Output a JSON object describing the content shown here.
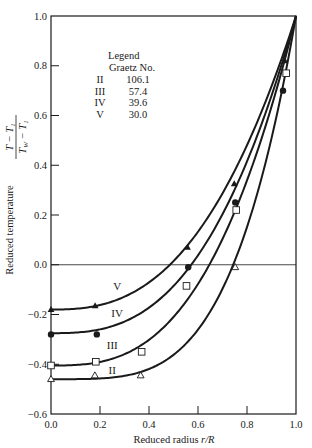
{
  "chart_data": {
    "type": "line",
    "title": "",
    "xlabel": "Reduced radius r/R",
    "ylabel": "Reduced temperature (T - T_1)/(T_W - T_1)",
    "xlim": [
      0.0,
      1.0
    ],
    "ylim": [
      -0.6,
      1.0
    ],
    "xticks": [
      "0.0",
      "0.2",
      "0.4",
      "0.6",
      "0.8",
      "1.0"
    ],
    "yticks": [
      "1.0",
      "0.8",
      "0.6",
      "0.4",
      "0.2",
      "0.0",
      "-0.2",
      "-0.4",
      "-0.6"
    ],
    "grid": false,
    "reference_line": {
      "y": 0.0
    },
    "legend": {
      "title": "Legend",
      "subtitle": "Graetz No.",
      "position": "upper-left",
      "entries": [
        {
          "label": "II",
          "value": "106.1",
          "marker": "open-triangle"
        },
        {
          "label": "III",
          "value": "57.4",
          "marker": "open-square"
        },
        {
          "label": "IV",
          "value": "39.6",
          "marker": "filled-circle"
        },
        {
          "label": "V",
          "value": "30.0",
          "marker": "filled-triangle"
        }
      ]
    },
    "series": [
      {
        "name": "V",
        "graetz": 30.0,
        "marker": "filled-triangle",
        "curve": {
          "a": -0.18,
          "n": 2.6
        },
        "label_pos": [
          0.27,
          -0.1
        ],
        "points": [
          [
            0.0,
            -0.18
          ],
          [
            0.18,
            -0.165
          ],
          [
            0.557,
            0.07
          ],
          [
            0.748,
            0.325
          ],
          [
            0.955,
            0.82
          ]
        ]
      },
      {
        "name": "IV",
        "graetz": 39.6,
        "marker": "filled-circle",
        "curve": {
          "a": -0.275,
          "n": 2.75
        },
        "label_pos": [
          0.27,
          -0.21
        ],
        "points": [
          [
            0.0,
            -0.28
          ],
          [
            0.187,
            -0.28
          ],
          [
            0.56,
            -0.01
          ],
          [
            0.752,
            0.25
          ],
          [
            0.947,
            0.7
          ]
        ]
      },
      {
        "name": "III",
        "graetz": 57.4,
        "marker": "open-square",
        "curve": {
          "a": -0.405,
          "n": 2.85
        },
        "label_pos": [
          0.25,
          -0.34
        ],
        "points": [
          [
            0.0,
            -0.405
          ],
          [
            0.183,
            -0.39
          ],
          [
            0.37,
            -0.35
          ],
          [
            0.553,
            -0.085
          ],
          [
            0.756,
            0.22
          ],
          [
            0.96,
            0.77
          ]
        ]
      },
      {
        "name": "II",
        "graetz": 106.1,
        "marker": "open-triangle",
        "curve": {
          "a": -0.46,
          "n": 3.9
        },
        "label_pos": [
          0.25,
          -0.44
        ],
        "points": [
          [
            0.0,
            -0.46
          ],
          [
            0.179,
            -0.445
          ],
          [
            0.366,
            -0.445
          ],
          [
            0.752,
            -0.01
          ]
        ]
      }
    ]
  },
  "axes": {
    "x_title_main": "Reduced radius ",
    "x_title_var": "r/R",
    "y_title_main": "Reduced temperature",
    "y_frac_num": "T − T",
    "y_frac_num_sub": "1",
    "y_frac_den": "T",
    "y_frac_den_sub_w": "W",
    "y_frac_den_mid": " − T",
    "y_frac_den_sub": "1"
  },
  "colors": {
    "ink": "#1a1a1a",
    "background": "#ffffff"
  }
}
